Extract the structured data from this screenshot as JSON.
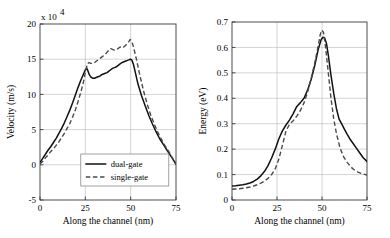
{
  "figure": {
    "name": "velocity-and-energy-along-channel",
    "panel_count": 2
  },
  "chart_data": [
    {
      "type": "line",
      "panel": "left",
      "title": "",
      "xlabel": "Along the channel (nm)",
      "ylabel": "Velocity (m/s)",
      "y_multiplier": "x 10",
      "y_multiplier_exponent": "4",
      "xlim": [
        0,
        75
      ],
      "ylim": [
        -5,
        20
      ],
      "xticks": [
        0,
        25,
        50,
        75
      ],
      "yticks": [
        -5,
        0,
        5,
        10,
        15,
        20
      ],
      "xtick_labels": [
        "0",
        "25",
        "50",
        "75"
      ],
      "ytick_labels": [
        "-5",
        "0",
        "5",
        "10",
        "15",
        "20"
      ],
      "grid": true,
      "legend_position": "lower-center",
      "series": [
        {
          "name": "dual-gate",
          "style": "solid",
          "color": "#111111",
          "x": [
            0,
            1.5,
            3,
            4.5,
            6,
            7.5,
            9,
            10.5,
            12,
            13.5,
            15,
            16.5,
            18,
            19.5,
            21,
            22.5,
            24,
            25,
            25.8,
            26.5,
            27.2,
            28,
            29,
            30,
            31,
            32,
            33,
            34,
            35,
            36,
            37,
            38,
            39,
            40,
            41,
            42,
            43,
            44,
            45,
            46,
            47,
            48,
            49,
            49.8,
            50.6,
            51.5,
            52.5,
            54,
            56,
            58,
            60,
            62,
            64,
            66,
            68,
            70,
            72,
            73.5,
            75
          ],
          "y": [
            0.3,
            0.9,
            1.5,
            2.1,
            2.6,
            3.2,
            3.8,
            4.5,
            5.2,
            6.0,
            6.9,
            7.8,
            8.8,
            9.9,
            11.0,
            12.0,
            12.9,
            13.5,
            13.7,
            13.3,
            12.8,
            12.5,
            12.3,
            12.3,
            12.4,
            12.5,
            12.6,
            12.8,
            12.9,
            13.0,
            13.1,
            13.3,
            13.5,
            13.7,
            13.8,
            13.9,
            14.1,
            14.3,
            14.5,
            14.6,
            14.7,
            14.8,
            14.9,
            15.0,
            14.9,
            14.3,
            13.2,
            11.5,
            9.8,
            8.4,
            7.0,
            5.8,
            4.7,
            3.7,
            2.9,
            2.1,
            1.3,
            0.7,
            0.1
          ]
        },
        {
          "name": "single-gate",
          "style": "dashed",
          "color": "#4a4a4a",
          "x": [
            0,
            1.5,
            3,
            4.5,
            6,
            7.5,
            9,
            10.5,
            12,
            13.5,
            15,
            16.5,
            18,
            19.5,
            21,
            22.5,
            24,
            25.2,
            26.2,
            27,
            28,
            29,
            30,
            31,
            32,
            33,
            34,
            35,
            36,
            37,
            38,
            39,
            40,
            41,
            42,
            43,
            44,
            45,
            46,
            47,
            48,
            49,
            49.7,
            50.5,
            51.5,
            53,
            55,
            57,
            59,
            61,
            63,
            65,
            67,
            69,
            71,
            73,
            75
          ],
          "y": [
            0.1,
            0.5,
            1.0,
            1.4,
            1.9,
            2.3,
            2.8,
            3.3,
            3.9,
            4.5,
            5.2,
            5.9,
            6.8,
            7.8,
            9.0,
            10.3,
            11.8,
            13.4,
            14.4,
            14.5,
            14.4,
            14.4,
            14.5,
            14.7,
            14.9,
            15.1,
            15.3,
            15.5,
            15.7,
            16.0,
            16.3,
            16.5,
            16.4,
            16.3,
            16.4,
            16.5,
            16.7,
            16.8,
            16.7,
            16.9,
            17.2,
            17.5,
            17.8,
            17.6,
            16.8,
            15.2,
            12.8,
            10.6,
            8.7,
            7.1,
            5.8,
            4.6,
            3.6,
            2.7,
            1.9,
            1.0,
            0.0
          ]
        }
      ]
    },
    {
      "type": "line",
      "panel": "right",
      "title": "",
      "xlabel": "Along the channel (nm)",
      "ylabel": "Energy (eV)",
      "xlim": [
        0,
        75
      ],
      "ylim": [
        0,
        0.7
      ],
      "xticks": [
        0,
        25,
        50,
        75
      ],
      "yticks": [
        0,
        0.1,
        0.2,
        0.3,
        0.4,
        0.5,
        0.6,
        0.7
      ],
      "xtick_labels": [
        "0",
        "25",
        "50",
        "75"
      ],
      "ytick_labels": [
        "0",
        "0.1",
        "0.2",
        "0.3",
        "0.4",
        "0.5",
        "0.6",
        "0.7"
      ],
      "grid": true,
      "legend_position": "none",
      "series": [
        {
          "name": "dual-gate",
          "style": "solid",
          "color": "#111111",
          "x": [
            0,
            2,
            4,
            6,
            8,
            10,
            12,
            14,
            16,
            18,
            20,
            22,
            24,
            26,
            28,
            30,
            32,
            34,
            36,
            38,
            40,
            42,
            44,
            46,
            48,
            49.5,
            50.5,
            51.5,
            52.5,
            53.5,
            55,
            56.5,
            58,
            59.5,
            61,
            62.5,
            64,
            65.5,
            67,
            69,
            71,
            73,
            75
          ],
          "y": [
            0.055,
            0.056,
            0.058,
            0.06,
            0.063,
            0.067,
            0.073,
            0.082,
            0.095,
            0.112,
            0.135,
            0.165,
            0.2,
            0.24,
            0.272,
            0.295,
            0.315,
            0.34,
            0.368,
            0.383,
            0.4,
            0.432,
            0.475,
            0.53,
            0.595,
            0.63,
            0.64,
            0.637,
            0.615,
            0.57,
            0.49,
            0.42,
            0.36,
            0.318,
            0.298,
            0.278,
            0.258,
            0.24,
            0.225,
            0.205,
            0.185,
            0.165,
            0.152
          ]
        },
        {
          "name": "single-gate",
          "style": "dashed",
          "color": "#4a4a4a",
          "x": [
            0,
            2,
            4,
            6,
            8,
            10,
            12,
            14,
            16,
            18,
            20,
            22,
            24,
            26,
            28,
            30,
            32,
            34,
            36,
            38,
            40,
            42,
            44,
            46,
            48,
            49,
            49.8,
            50.8,
            52,
            53.5,
            55,
            56.5,
            58,
            60,
            62,
            64,
            66,
            68,
            70,
            72,
            75
          ],
          "y": [
            0.042,
            0.043,
            0.044,
            0.046,
            0.048,
            0.051,
            0.055,
            0.06,
            0.066,
            0.074,
            0.085,
            0.1,
            0.122,
            0.16,
            0.215,
            0.272,
            0.298,
            0.312,
            0.33,
            0.352,
            0.382,
            0.425,
            0.478,
            0.54,
            0.61,
            0.65,
            0.668,
            0.66,
            0.6,
            0.5,
            0.4,
            0.32,
            0.262,
            0.205,
            0.17,
            0.148,
            0.13,
            0.118,
            0.11,
            0.104,
            0.098
          ]
        }
      ]
    }
  ]
}
